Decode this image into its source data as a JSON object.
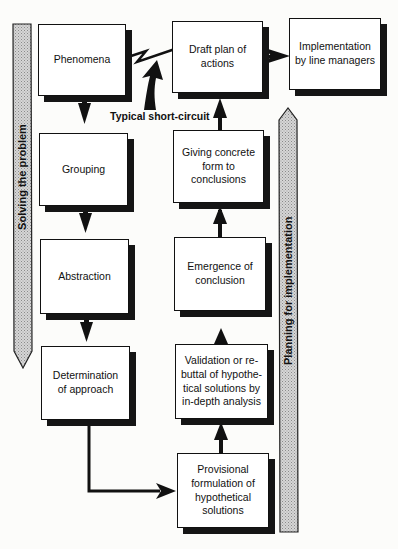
{
  "diagram": {
    "bands": {
      "left": {
        "label": "Solving the problem",
        "direction": "down"
      },
      "right": {
        "label": "Planning for implementation",
        "direction": "up"
      }
    },
    "short_circuit_label": "Typical short-circuit",
    "nodes": [
      {
        "id": "phenomena",
        "label": "Phenomena"
      },
      {
        "id": "grouping",
        "label": "Grouping"
      },
      {
        "id": "abstraction",
        "label": "Abstraction"
      },
      {
        "id": "determination",
        "label": "Determination\nof approach"
      },
      {
        "id": "provisional",
        "label": "Provisional\nformulation of\nhypothetical\nsolutions"
      },
      {
        "id": "validation",
        "label": "Validation or re-\nbuttal of hypothe-\ntical solutions by\nin-depth analysis"
      },
      {
        "id": "emergence",
        "label": "Emergence of\nconclusion"
      },
      {
        "id": "giving",
        "label": "Giving concrete\nform to\nconclusions"
      },
      {
        "id": "draft",
        "label": "Draft plan of\nactions"
      },
      {
        "id": "implementation",
        "label": "Implementation\nby line managers"
      }
    ],
    "edges": [
      {
        "from": "phenomena",
        "to": "grouping"
      },
      {
        "from": "grouping",
        "to": "abstraction"
      },
      {
        "from": "abstraction",
        "to": "determination"
      },
      {
        "from": "determination",
        "to": "provisional"
      },
      {
        "from": "provisional",
        "to": "validation"
      },
      {
        "from": "validation",
        "to": "emergence"
      },
      {
        "from": "emergence",
        "to": "giving"
      },
      {
        "from": "giving",
        "to": "draft"
      },
      {
        "from": "draft",
        "to": "implementation"
      },
      {
        "from": "phenomena",
        "to": "draft",
        "type": "short-circuit"
      }
    ]
  }
}
